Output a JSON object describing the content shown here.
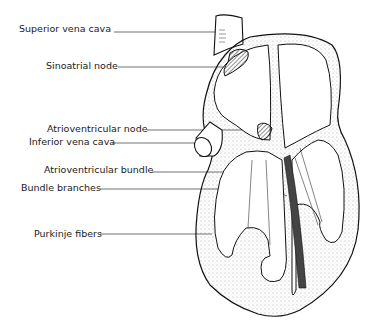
{
  "diagram": {
    "labels": [
      {
        "text": "Superior vena cava",
        "x": 19,
        "y": 28
      },
      {
        "text": "Sinoatrial node",
        "x": 46,
        "y": 63
      },
      {
        "text": "Atrioventricular node",
        "x": 47,
        "y": 126
      },
      {
        "text": "Inferior vena cava",
        "x": 29,
        "y": 139
      },
      {
        "text": "Atrioventricular bundle",
        "x": 44,
        "y": 167
      },
      {
        "text": "Bundle branches",
        "x": 21,
        "y": 185
      },
      {
        "text": "Purkinje fibers",
        "x": 34,
        "y": 231
      }
    ]
  }
}
